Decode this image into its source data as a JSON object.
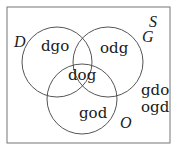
{
  "diagram": {
    "type": "venn",
    "universe_label": "S",
    "sets": [
      {
        "name": "D",
        "cx": 57,
        "cy": 62,
        "r": 35
      },
      {
        "name": "G",
        "cx": 108,
        "cy": 62,
        "r": 35
      },
      {
        "name": "O",
        "cx": 82,
        "cy": 99,
        "r": 35
      }
    ],
    "regions": {
      "D_only": "dgo",
      "G_only": "odg",
      "all_three": "dog",
      "O_only": "god",
      "outside_1": "gdo",
      "outside_2": "ogd"
    },
    "colors": {
      "stroke": "#555555",
      "frame": "#777777",
      "text": "#1a1a1a"
    }
  }
}
